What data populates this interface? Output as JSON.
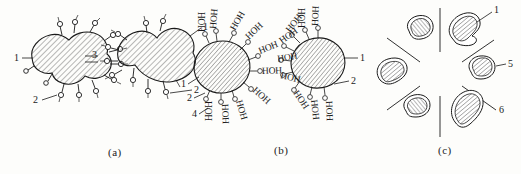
{
  "figure": {
    "type": "scientific-diagram",
    "panels": [
      {
        "id": "a",
        "caption": "(a)",
        "description": "Two hatched colloidal particles bearing surface hydroxyl (OH) groups, associated through hydrogen bonding",
        "callouts": [
          {
            "label": "1",
            "target": "particle-body-left",
            "position": "left"
          },
          {
            "label": "2",
            "target": "hydroxyl-group-left",
            "position": "bottom-left"
          },
          {
            "label": "3",
            "target": "hydrogen-bond-bridge",
            "position": "center"
          },
          {
            "label": "1",
            "target": "particle-body-right",
            "position": "top-right"
          },
          {
            "label": "2",
            "target": "hydroxyl-group-right",
            "position": "bottom-right"
          }
        ]
      },
      {
        "id": "b",
        "caption": "(b)",
        "description": "Two hatched colloidal particles with radiating bound water molecules labelled HOH forming hydration shells",
        "water_label": "HOH",
        "callouts": [
          {
            "label": "1",
            "target": "particle-body-left",
            "position": "left"
          },
          {
            "label": "2",
            "target": "hydroxyl-group-left",
            "position": "left-lower"
          },
          {
            "label": "4",
            "target": "bound-water-molecule",
            "position": "bottom-left"
          },
          {
            "label": "1",
            "target": "particle-body-right",
            "position": "right"
          },
          {
            "label": "2",
            "target": "hydroxyl-group-right",
            "position": "bottom-right"
          }
        ]
      },
      {
        "id": "c",
        "caption": "(c)",
        "description": "Six dispersed hatched particles arranged radially, separated by straight divider lines",
        "callouts": [
          {
            "label": "1",
            "target": "dispersed-particle-top-right",
            "position": "top-right"
          },
          {
            "label": "5",
            "target": "dispersed-particle-middle-right",
            "position": "right"
          },
          {
            "label": "6",
            "target": "divider-line-lower-right",
            "position": "right-lower"
          }
        ]
      }
    ]
  },
  "captions": {
    "a": "(a)",
    "b": "(b)",
    "c": "(c)"
  },
  "labels": {
    "one": "1",
    "two": "2",
    "three": "3",
    "four": "4",
    "five": "5",
    "six": "6",
    "water": "HOH"
  },
  "colors": {
    "ink": "#1a1a1a",
    "hatch": "#555555",
    "background": "#fdfdfb"
  }
}
